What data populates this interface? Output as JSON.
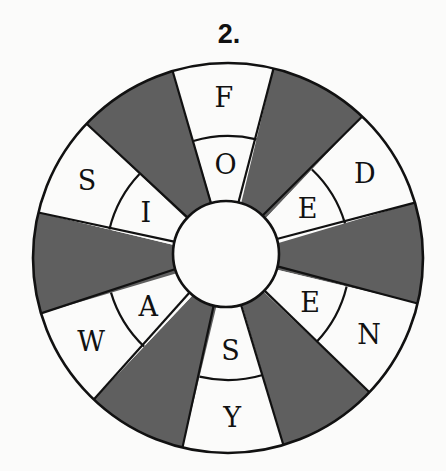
{
  "title": "2.",
  "wheel": {
    "center": [
      228,
      258
    ],
    "outer_radius": 195,
    "mid_radius": 122,
    "inner_radius": 53,
    "inner_center": [
      226,
      254
    ],
    "rotation_deg": -1.5,
    "sector_count": 12,
    "colors": {
      "shaded": "#5f5f5f",
      "blank": "#fbfbfa",
      "line": "#111111"
    },
    "sectors": [
      {
        "index": 0,
        "shaded": false,
        "outer": "F",
        "inner": "O"
      },
      {
        "index": 1,
        "shaded": true
      },
      {
        "index": 2,
        "shaded": false,
        "outer": "D",
        "inner": "E"
      },
      {
        "index": 3,
        "shaded": true
      },
      {
        "index": 4,
        "shaded": false,
        "outer": "N",
        "inner": "E"
      },
      {
        "index": 5,
        "shaded": true
      },
      {
        "index": 6,
        "shaded": false,
        "outer": "Y",
        "inner": "S"
      },
      {
        "index": 7,
        "shaded": true
      },
      {
        "index": 8,
        "shaded": false,
        "outer": "W",
        "inner": "A"
      },
      {
        "index": 9,
        "shaded": true
      },
      {
        "index": 10,
        "shaded": false,
        "outer": "S",
        "inner": "I"
      },
      {
        "index": 11,
        "shaded": true
      }
    ]
  }
}
